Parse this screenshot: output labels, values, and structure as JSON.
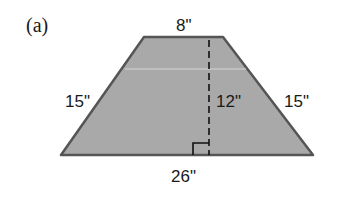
{
  "figure": {
    "label": "(a)",
    "shape": "isosceles trapezoid",
    "fill_color": "#a9a9a9",
    "stroke_color": "#555555",
    "dimensions": {
      "top_base": "8\"",
      "bottom_base": "26\"",
      "left_side": "15\"",
      "right_side": "15\"",
      "height": "12\""
    }
  }
}
